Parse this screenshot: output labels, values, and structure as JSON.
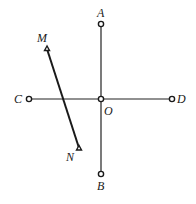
{
  "diagram": {
    "background": "#ffffff",
    "line_color": "#222222",
    "points": {
      "A": {
        "label": "A",
        "x": 101,
        "y": 24,
        "marker": "circle"
      },
      "B": {
        "label": "B",
        "x": 101,
        "y": 174,
        "marker": "circle"
      },
      "C": {
        "label": "C",
        "x": 29,
        "y": 99,
        "marker": "circle"
      },
      "D": {
        "label": "D",
        "x": 172,
        "y": 99,
        "marker": "circle"
      },
      "O": {
        "label": "O",
        "x": 101,
        "y": 99,
        "marker": "circle"
      },
      "M": {
        "label": "M",
        "x": 47,
        "y": 49,
        "marker": "triangle"
      },
      "N": {
        "label": "N",
        "x": 79,
        "y": 148,
        "marker": "triangle"
      }
    },
    "segments": [
      {
        "from": "A",
        "to": "B",
        "name": "AB"
      },
      {
        "from": "C",
        "to": "D",
        "name": "CD"
      },
      {
        "from": "M",
        "to": "N",
        "name": "MN"
      }
    ]
  }
}
